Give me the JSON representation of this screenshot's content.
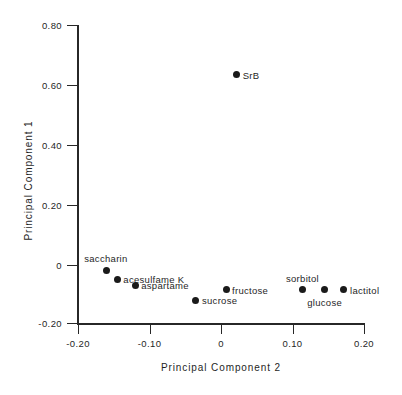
{
  "chart_data": {
    "type": "scatter",
    "title": "",
    "xlabel": "Principal Component 2",
    "ylabel": "Principal Component 1",
    "xlim": [
      -0.2,
      0.2
    ],
    "ylim": [
      -0.2,
      0.8
    ],
    "xticks": [
      "-0.20",
      "-0.10",
      "0",
      "0.10",
      "0.20"
    ],
    "xtick_values": [
      -0.2,
      -0.1,
      0,
      0.1,
      0.2
    ],
    "yticks": [
      "0.80",
      "0.60",
      "0.40",
      "0.20",
      "0",
      "-0.20"
    ],
    "ytick_values": [
      0.8,
      0.6,
      0.4,
      0.2,
      0,
      -0.2
    ],
    "grid": false,
    "legend": "none",
    "points": [
      {
        "label": "SrB",
        "x": 0.022,
        "y": 0.635,
        "label_pos": "right"
      },
      {
        "label": "saccharin",
        "x": -0.16,
        "y": -0.018,
        "label_pos": "above-right"
      },
      {
        "label": "acesulfame K",
        "x": -0.145,
        "y": -0.048,
        "label_pos": "right"
      },
      {
        "label": "aspartame",
        "x": -0.12,
        "y": -0.068,
        "label_pos": "right"
      },
      {
        "label": "sucrose",
        "x": -0.035,
        "y": -0.118,
        "label_pos": "right"
      },
      {
        "label": "fructose",
        "x": 0.007,
        "y": -0.083,
        "label_pos": "right"
      },
      {
        "label": "sorbitol",
        "x": 0.114,
        "y": -0.083,
        "label_pos": "above"
      },
      {
        "label": "glucose",
        "x": 0.145,
        "y": -0.083,
        "label_pos": "below"
      },
      {
        "label": "lactitol",
        "x": 0.172,
        "y": -0.083,
        "label_pos": "right"
      }
    ]
  }
}
